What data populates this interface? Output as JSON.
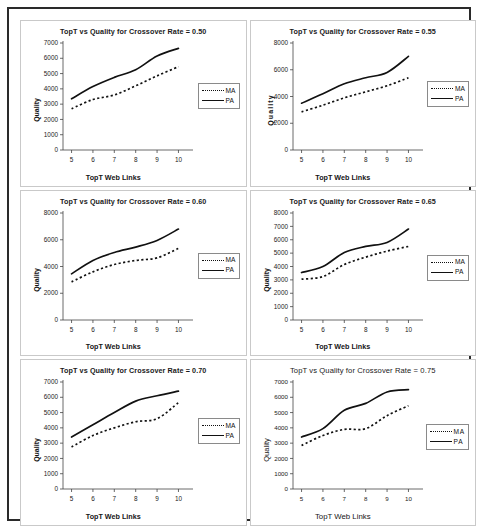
{
  "figure": {
    "name": "six-panel-line-chart-figure",
    "panel_count": 6
  },
  "legend": {
    "ma_label": "MA",
    "pa_label": "PA"
  },
  "axis_titles": {
    "x": "TopT Web Links",
    "y": "Quality"
  },
  "chart_data": [
    {
      "type": "line",
      "title": "TopT vs Quality for Crossover Rate = 0.50",
      "xlabel": "TopT Web Links",
      "ylabel": "Quality",
      "x": [
        5,
        6,
        7,
        8,
        9,
        10
      ],
      "xlim": [
        4.6,
        10.4
      ],
      "ylim": [
        0,
        7000
      ],
      "yticks": [
        0,
        1000,
        2000,
        3000,
        4000,
        5000,
        6000,
        7000
      ],
      "xticks": [
        5,
        6,
        7,
        8,
        9,
        10
      ],
      "grid": false,
      "legend_position": "right",
      "series": [
        {
          "name": "MA",
          "style": "dotted",
          "values": [
            2700,
            3300,
            3600,
            4200,
            4850,
            5450
          ]
        },
        {
          "name": "PA",
          "style": "solid",
          "values": [
            3350,
            4150,
            4750,
            5250,
            6150,
            6650
          ]
        }
      ]
    },
    {
      "type": "line",
      "title": "TopT vs Quality for Crossover Rate = 0.55",
      "xlabel": "TopT Web Links",
      "ylabel": "Quality",
      "x": [
        5,
        6,
        7,
        8,
        9,
        10
      ],
      "xlim": [
        4.6,
        10.4
      ],
      "ylim": [
        0,
        8000
      ],
      "yticks": [
        0,
        2000,
        4000,
        6000,
        8000
      ],
      "xticks": [
        5,
        6,
        7,
        8,
        9,
        10
      ],
      "grid": false,
      "legend_position": "right",
      "series": [
        {
          "name": "MA",
          "style": "dotted",
          "values": [
            2850,
            3350,
            3900,
            4350,
            4800,
            5400
          ]
        },
        {
          "name": "PA",
          "style": "solid",
          "values": [
            3500,
            4200,
            4950,
            5400,
            5800,
            7000
          ]
        }
      ]
    },
    {
      "type": "line",
      "title": "TopT vs Quality for Crossover Rate = 0.60",
      "xlabel": "TopT Web Links",
      "ylabel": "Quality",
      "x": [
        5,
        6,
        7,
        8,
        9,
        10
      ],
      "xlim": [
        4.6,
        10.4
      ],
      "ylim": [
        0,
        8000
      ],
      "yticks": [
        0,
        2000,
        4000,
        6000,
        8000
      ],
      "xticks": [
        5,
        6,
        7,
        8,
        9,
        10
      ],
      "grid": false,
      "legend_position": "right",
      "series": [
        {
          "name": "MA",
          "style": "dotted",
          "values": [
            2850,
            3600,
            4150,
            4450,
            4650,
            5350
          ]
        },
        {
          "name": "PA",
          "style": "solid",
          "values": [
            3450,
            4450,
            5050,
            5450,
            5950,
            6800
          ]
        }
      ]
    },
    {
      "type": "line",
      "title": "TopT vs Quality for Crossover Rate = 0.65",
      "xlabel": "TopT Web Links",
      "ylabel": "Quality",
      "x": [
        5,
        6,
        7,
        8,
        9,
        10
      ],
      "xlim": [
        4.6,
        10.4
      ],
      "ylim": [
        0,
        8000
      ],
      "yticks": [
        0,
        1000,
        2000,
        3000,
        4000,
        5000,
        6000,
        7000,
        8000
      ],
      "xticks": [
        5,
        6,
        7,
        8,
        9,
        10
      ],
      "grid": false,
      "legend_position": "right",
      "series": [
        {
          "name": "MA",
          "style": "dotted",
          "values": [
            3050,
            3250,
            4150,
            4700,
            5150,
            5500
          ]
        },
        {
          "name": "PA",
          "style": "solid",
          "values": [
            3550,
            4000,
            5050,
            5500,
            5800,
            6800
          ]
        }
      ]
    },
    {
      "type": "line",
      "title": "TopT vs Quality for Crossover Rate = 0.70",
      "xlabel": "TopT Web Links",
      "ylabel": "Quality",
      "x": [
        5,
        6,
        7,
        8,
        9,
        10
      ],
      "xlim": [
        4.6,
        10.4
      ],
      "ylim": [
        0,
        7000
      ],
      "yticks": [
        0,
        1000,
        2000,
        3000,
        4000,
        5000,
        6000,
        7000
      ],
      "xticks": [
        5,
        6,
        7,
        8,
        9,
        10
      ],
      "grid": false,
      "legend_position": "right",
      "series": [
        {
          "name": "MA",
          "style": "dotted",
          "values": [
            2750,
            3500,
            4000,
            4400,
            4600,
            5650
          ]
        },
        {
          "name": "PA",
          "style": "solid",
          "values": [
            3400,
            4200,
            5000,
            5750,
            6100,
            6400
          ]
        }
      ]
    },
    {
      "type": "line",
      "title": "TopT vs Quality for Crossover Rate = 0.75",
      "xlabel": "TopT Web Links",
      "ylabel": "Quality",
      "x": [
        5,
        6,
        7,
        8,
        9,
        10
      ],
      "xlim": [
        4.6,
        10.4
      ],
      "ylim": [
        0,
        7000
      ],
      "yticks": [
        0,
        1000,
        2000,
        3000,
        4000,
        5000,
        6000,
        7000
      ],
      "xticks": [
        5,
        6,
        7,
        8,
        9,
        10
      ],
      "grid": false,
      "legend_position": "right",
      "series": [
        {
          "name": "MA",
          "style": "dotted",
          "values": [
            2850,
            3500,
            3900,
            3950,
            4800,
            5450
          ]
        },
        {
          "name": "PA",
          "style": "solid",
          "values": [
            3400,
            3950,
            5150,
            5600,
            6350,
            6500
          ]
        }
      ]
    }
  ],
  "colors": {
    "line": "#111111",
    "axis": "#333333",
    "panel_border": "#c9c9c9",
    "outer_border": "#2a2a2a",
    "background": "#ffffff"
  }
}
